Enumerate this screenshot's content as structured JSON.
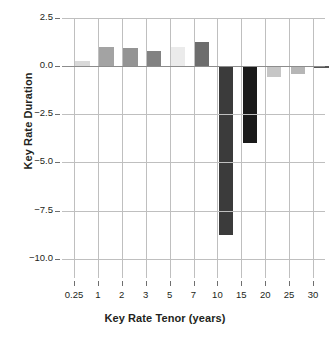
{
  "chart_data": {
    "type": "bar",
    "title": "",
    "xlabel": "Key Rate Tenor (years)",
    "ylabel": "Key Rate Duration",
    "categories": [
      "0.25",
      "1",
      "2",
      "3",
      "5",
      "7",
      "10",
      "15",
      "20",
      "25",
      "30"
    ],
    "values": [
      0.27,
      1.02,
      0.94,
      0.8,
      0.97,
      1.24,
      -8.77,
      -3.98,
      -0.57,
      -0.4,
      -0.05
    ],
    "bar_colors": [
      "#d9d9d9",
      "#a3a3a3",
      "#949494",
      "#828282",
      "#ebebeb",
      "#6d6d6d",
      "#3b3b3b",
      "#1a1a1a",
      "#c6c6c6",
      "#b6b6b6",
      "#555555"
    ],
    "ylim": [
      -11.0,
      2.5
    ],
    "ytick_labels": [
      "2.5",
      "0.0",
      "−2.5",
      "−5.0",
      "−7.5",
      "−10.0"
    ],
    "ytick_values": [
      2.5,
      0.0,
      -2.5,
      -5.0,
      -7.5,
      -10.0
    ],
    "grid": "both",
    "legend": "none",
    "gridline_color": "#bfbfbf",
    "zero_line_color": "#8c8c8c",
    "text_color": "#231f20",
    "background": "#ffffff"
  }
}
